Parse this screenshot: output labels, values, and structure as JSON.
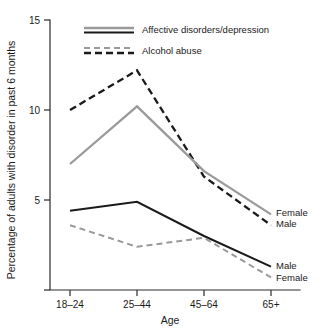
{
  "chart_data": {
    "type": "line",
    "title": "",
    "xlabel": "Age",
    "ylabel": "Percentage of adults with disorder in past 6 months",
    "categories": [
      "18–24",
      "25–44",
      "45–64",
      "65+"
    ],
    "x_tick_labels": [
      "18–24",
      "25–44",
      "45–64",
      "65+"
    ],
    "y_tick_labels": [
      "5",
      "10",
      "15"
    ],
    "y_tick_values": [
      5,
      10,
      15
    ],
    "ylim": [
      0,
      15
    ],
    "grid": false,
    "legend_position": "top-center",
    "series": [
      {
        "name": "Alcohol abuse – Male",
        "disorder": "Alcohol abuse",
        "sex": "Male",
        "style": "dashed",
        "color": "#1a1a1a",
        "end_label": "Male",
        "values": [
          10.0,
          12.2,
          6.3,
          3.6
        ]
      },
      {
        "name": "Affective disorders/depression – Female",
        "disorder": "Affective disorders/depression",
        "sex": "Female",
        "style": "solid",
        "color": "#9a9a9a",
        "end_label": "Female",
        "values": [
          7.0,
          10.2,
          6.6,
          4.2
        ]
      },
      {
        "name": "Affective disorders/depression – Male",
        "disorder": "Affective disorders/depression",
        "sex": "Male",
        "style": "solid",
        "color": "#1a1a1a",
        "end_label": "Male",
        "values": [
          4.4,
          4.9,
          3.0,
          1.3
        ]
      },
      {
        "name": "Alcohol abuse – Female",
        "disorder": "Alcohol abuse",
        "sex": "Female",
        "style": "dashed",
        "color": "#9a9a9a",
        "end_label": "Female",
        "values": [
          3.6,
          2.4,
          2.9,
          0.7
        ]
      }
    ],
    "legend": [
      {
        "label": "Affective disorders/depression",
        "style": "solid"
      },
      {
        "label": "Alcohol abuse",
        "style": "dashed"
      }
    ],
    "endpoint_labels": [
      {
        "text": "Female",
        "series": "Affective disorders/depression – Female"
      },
      {
        "text": "Male",
        "series": "Alcohol abuse – Male"
      },
      {
        "text": "Male",
        "series": "Affective disorders/depression – Male"
      },
      {
        "text": "Female",
        "series": "Alcohol abuse – Female"
      }
    ],
    "colors": {
      "black": "#1a1a1a",
      "gray": "#9a9a9a",
      "axis": "#2b2b2b",
      "background": "#ffffff"
    }
  }
}
